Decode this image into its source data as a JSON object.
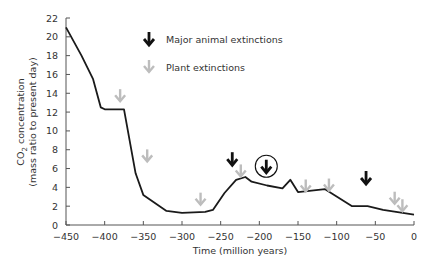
{
  "chart_data": {
    "type": "line",
    "title": "",
    "xlabel": "Time (million years)",
    "ylabel_line1": "CO2 concentration",
    "ylabel_line2": "(mass ratio to present day)",
    "xlim": [
      -450,
      0
    ],
    "ylim": [
      0,
      22
    ],
    "x_ticks": [
      -450,
      -400,
      -350,
      -300,
      -250,
      -200,
      -150,
      -100,
      -50,
      0
    ],
    "y_ticks": [
      0,
      2,
      4,
      6,
      8,
      10,
      12,
      14,
      16,
      18,
      20,
      22
    ],
    "grid": false,
    "series": [
      {
        "name": "CO2 concentration",
        "color": "#1a1a1a",
        "x": [
          -450,
          -430,
          -415,
          -405,
          -400,
          -375,
          -360,
          -350,
          -320,
          -300,
          -270,
          -260,
          -245,
          -230,
          -218,
          -210,
          -190,
          -170,
          -160,
          -150,
          -115,
          -80,
          -60,
          -40,
          0
        ],
        "values": [
          21,
          18,
          15.5,
          12.5,
          12.3,
          12.3,
          5.5,
          3.2,
          1.5,
          1.3,
          1.4,
          1.6,
          3.4,
          4.8,
          5.1,
          4.6,
          4.2,
          3.9,
          4.8,
          3.5,
          3.8,
          2.0,
          2.0,
          1.6,
          1.1
        ]
      }
    ],
    "legend": [
      {
        "label": "Major animal extinctions",
        "color": "#111111",
        "icon": "black-down-arrow"
      },
      {
        "label": "Plant extinctions",
        "color": "#bdbdbd",
        "icon": "grey-down-arrow"
      }
    ],
    "legend_position": "top-center",
    "annotations": {
      "animal_extinctions": [
        {
          "x": -235,
          "y_level": 7.1,
          "circled": false
        },
        {
          "x": -191,
          "y_level": 6.3,
          "circled": true
        },
        {
          "x": -62,
          "y_level": 5.1,
          "circled": false
        }
      ],
      "plant_extinctions": [
        {
          "x": -380,
          "y_level": 13.8
        },
        {
          "x": -345,
          "y_level": 7.4
        },
        {
          "x": -276,
          "y_level": 2.8
        },
        {
          "x": -224,
          "y_level": 5.8
        },
        {
          "x": -140,
          "y_level": 4.2
        },
        {
          "x": -110,
          "y_level": 4.3
        },
        {
          "x": -25,
          "y_level": 2.9
        },
        {
          "x": -15,
          "y_level": 2.1
        }
      ]
    }
  },
  "caption_cutoff": "…"
}
